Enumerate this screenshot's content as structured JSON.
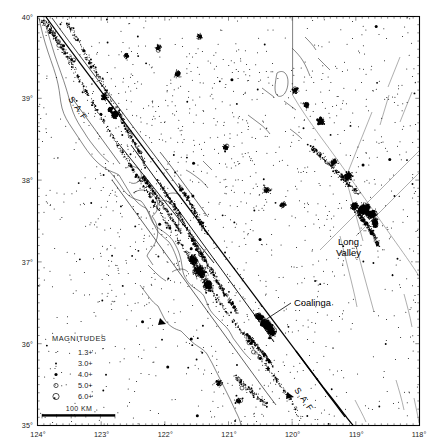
{
  "figure": {
    "type": "map",
    "background": "#ffffff",
    "ink": "#000000"
  },
  "chart_data": {
    "type": "scatter",
    "xlabel": "Longitude (West)",
    "ylabel": "Latitude (North)",
    "xlim": [
      -124,
      -118
    ],
    "ylim": [
      35,
      40
    ],
    "grid": false,
    "legend_position": "lower-left",
    "x_ticks": [
      "124°",
      "123°",
      "122°",
      "121°",
      "120°",
      "119°",
      "118°"
    ],
    "y_ticks": [
      "40°",
      "39°",
      "38°",
      "37°",
      "36°",
      "35°"
    ],
    "x_tick_values": [
      -124,
      -123,
      -122,
      -121,
      -120,
      -119,
      -118
    ],
    "y_tick_values": [
      40,
      39,
      38,
      37,
      36,
      35
    ],
    "minor_tick_interval_deg": 0.1,
    "series": [
      {
        "name": "Earthquake epicenters",
        "symbol": "dot",
        "color": "#000000",
        "note": "Epicenters scaled by magnitude; dense clusters at Coalinga, Long Valley, and along the San Andreas/Calaveras/Hayward systems."
      }
    ],
    "annotations": [
      {
        "text": "Coalinga",
        "lon": -119.95,
        "lat": 36.36,
        "leader": true
      },
      {
        "text": "Long Valley",
        "lon": -119.05,
        "lat": 37.15,
        "leader": false
      },
      {
        "text": "S.A.F",
        "lon": -123.35,
        "lat": 38.85,
        "rotation": 55
      },
      {
        "text": "S.A.F",
        "lon": -120.3,
        "lat": 35.2,
        "rotation": 55
      }
    ]
  },
  "axes": {
    "x_labels": [
      "124°",
      "123°",
      "122°",
      "121°",
      "120°",
      "119°",
      "118°"
    ],
    "y_labels": [
      "40°",
      "39°",
      "38°",
      "37°",
      "36°",
      "35°"
    ]
  },
  "labels": {
    "coalinga": "Coalinga",
    "long_valley_line1": "Long",
    "long_valley_line2": "Valley",
    "saf_northwest": "S.A.F",
    "saf_southeast": "S.A.F"
  },
  "legend": {
    "title": "MAGNITUDES",
    "entries": [
      {
        "label": "1.3+",
        "symbol": "tiny-dot"
      },
      {
        "label": "3.0+",
        "symbol": "small-dot"
      },
      {
        "label": "4.0+",
        "symbol": "medium-dot"
      },
      {
        "label": "5.0+",
        "symbol": "small-open-circle"
      },
      {
        "label": "6.0+",
        "symbol": "large-open-circle"
      }
    ]
  },
  "scale_bar": {
    "label": "100 KM"
  }
}
